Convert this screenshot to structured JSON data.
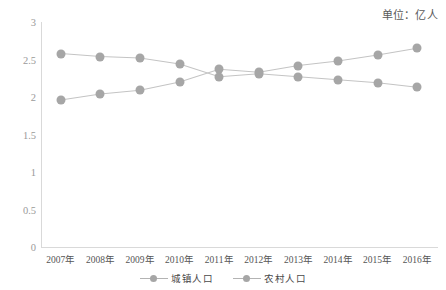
{
  "unit_note": "单位：亿人",
  "legend": {
    "items": [
      {
        "label": "城镇人口",
        "color": "#a6a6a6",
        "name": "urban-population"
      },
      {
        "label": "农村人口",
        "color": "#a6a6a6",
        "name": "rural-population"
      }
    ]
  },
  "axis": {
    "y_ticks": [
      "0",
      "0.5",
      "1",
      "1.5",
      "2",
      "2.5",
      "3"
    ],
    "x_ticks": [
      "2007年",
      "2008年",
      "2009年",
      "2010年",
      "2011年",
      "2012年",
      "2013年",
      "2014年",
      "2015年",
      "2016年"
    ]
  },
  "chart_data": {
    "type": "line",
    "title": "",
    "subtitle": "",
    "xlabel": "",
    "ylabel": "",
    "unit": "单位：亿人",
    "categories": [
      "2007年",
      "2008年",
      "2009年",
      "2010年",
      "2011年",
      "2012年",
      "2013年",
      "2014年",
      "2015年",
      "2016年"
    ],
    "series": [
      {
        "name": "城镇人口",
        "color": "#a6a6a6",
        "values": [
          1.96,
          2.04,
          2.09,
          2.2,
          2.37,
          2.33,
          2.42,
          2.48,
          2.56,
          2.65
        ]
      },
      {
        "name": "农村人口",
        "color": "#a6a6a6",
        "values": [
          2.58,
          2.54,
          2.52,
          2.44,
          2.27,
          2.31,
          2.27,
          2.23,
          2.19,
          2.13
        ]
      }
    ],
    "ylim": [
      0,
      3
    ],
    "ytick_step": 0.5,
    "grid": false,
    "legend_position": "bottom"
  }
}
